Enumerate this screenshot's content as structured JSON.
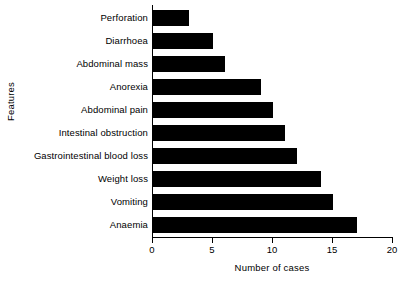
{
  "chart_data": {
    "type": "bar",
    "orientation": "horizontal",
    "title": "",
    "xlabel": "Number of cases",
    "ylabel": "Features",
    "xlim": [
      0,
      20
    ],
    "xticks": [
      0,
      5,
      10,
      15,
      20
    ],
    "grid": false,
    "legend": null,
    "bar_color": "#000000",
    "categories": [
      "Perforation",
      "Diarrhoea",
      "Abdominal mass",
      "Anorexia",
      "Abdominal pain",
      "Intestinal obstruction",
      "Gastrointestinal blood loss",
      "Weight loss",
      "Vomiting",
      "Anaemia"
    ],
    "values": [
      3,
      5,
      6,
      9,
      10,
      11,
      12,
      14,
      15,
      17
    ]
  }
}
